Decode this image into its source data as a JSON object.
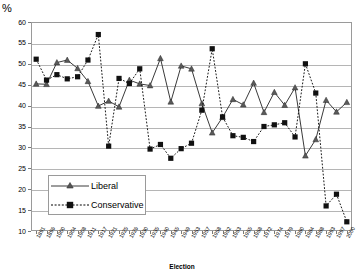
{
  "chart_data": {
    "type": "line",
    "title": "",
    "xlabel": "Election",
    "ylabel": "%",
    "ylim": [
      10,
      60
    ],
    "yticks": [
      10,
      15,
      20,
      25,
      30,
      35,
      40,
      45,
      50,
      55,
      60
    ],
    "grid": true,
    "legend_position": "inside-bottom-left",
    "categories": [
      "1891",
      "1896",
      "1900",
      "1904",
      "1908",
      "1911",
      "1917",
      "1921",
      "1925",
      "1926",
      "1930",
      "1935",
      "1940",
      "1945",
      "1949",
      "1953",
      "1957",
      "1958",
      "1962",
      "1963",
      "1965",
      "1968",
      "1972",
      "1974",
      "1979",
      "1980",
      "1984",
      "1988",
      "1993",
      "1997",
      "2000"
    ],
    "series": [
      {
        "name": "Liberal",
        "marker": "triangle",
        "linestyle": "solid",
        "color": "#3a3a3a",
        "values": [
          45.2,
          45.1,
          50.3,
          50.9,
          48.9,
          45.8,
          39.9,
          41.1,
          39.7,
          46.1,
          45.2,
          44.8,
          51.3,
          40.9,
          49.5,
          48.8,
          40.5,
          33.5,
          37.2,
          41.5,
          40.2,
          45.4,
          38.4,
          43.2,
          40.1,
          44.3,
          28.0,
          31.9,
          41.3,
          38.5,
          40.8
        ]
      },
      {
        "name": "Conservative",
        "marker": "square",
        "linestyle": "dashed",
        "color": "#000000",
        "values": [
          51.1,
          46.1,
          47.4,
          46.4,
          46.9,
          50.9,
          57.0,
          30.3,
          46.5,
          45.3,
          48.8,
          29.6,
          30.7,
          27.4,
          29.7,
          31.0,
          38.9,
          53.6,
          37.3,
          32.8,
          32.4,
          31.4,
          35.0,
          35.4,
          35.9,
          32.5,
          50.0,
          43.0,
          16.0,
          18.8,
          12.2
        ]
      }
    ],
    "legend": [
      {
        "label": "Liberal",
        "marker": "triangle",
        "linestyle": "solid"
      },
      {
        "label": "Conservative",
        "marker": "square",
        "linestyle": "dashed"
      }
    ]
  }
}
